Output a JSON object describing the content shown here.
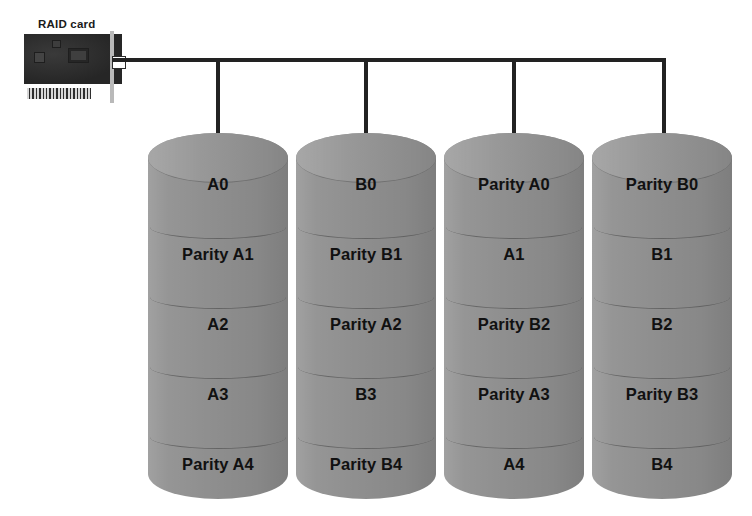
{
  "diagram": {
    "background_color": "#ffffff",
    "disk_color": "#8f8f8f",
    "line_color": "#222222",
    "text_color": "#111111"
  },
  "controller": {
    "label": "RAID card",
    "icons": {
      "card_body": "circuit-board-icon",
      "main_chip": "chip-icon",
      "secondary_chip": "chip-icon",
      "tertiary_chip": "chip-icon",
      "contacts": "edge-connector-icon",
      "bracket": "bracket-icon",
      "port": "port-icon"
    }
  },
  "bus": {
    "name": "controller-bus",
    "drop_count": 4
  },
  "disks": [
    {
      "name": "disk-1",
      "stripes": [
        "A0",
        "Parity A1",
        "A2",
        "A3",
        "Parity A4"
      ]
    },
    {
      "name": "disk-2",
      "stripes": [
        "B0",
        "Parity B1",
        "Parity A2",
        "B3",
        "Parity B4"
      ]
    },
    {
      "name": "disk-3",
      "stripes": [
        "Parity A0",
        "A1",
        "Parity B2",
        "Parity A3",
        "A4"
      ]
    },
    {
      "name": "disk-4",
      "stripes": [
        "Parity B0",
        "B1",
        "B2",
        "Parity B3",
        "B4"
      ]
    }
  ]
}
